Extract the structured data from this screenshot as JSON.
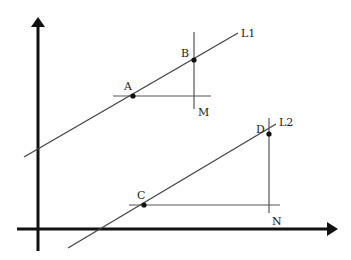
{
  "diagram": {
    "axes": {
      "x_axis": {
        "x1": 17,
        "y1": 229,
        "x2": 330,
        "y2": 229
      },
      "y_axis": {
        "x1": 38,
        "y1": 251,
        "x2": 38,
        "y2": 26
      }
    },
    "lines": [
      {
        "name": "L1",
        "label": "L1",
        "x1": 24,
        "y1": 157,
        "x2": 238,
        "y2": 33,
        "label_x": 241,
        "label_y": 37
      },
      {
        "name": "L2",
        "label": "L2",
        "x1": 68,
        "y1": 248,
        "x2": 276,
        "y2": 124,
        "label_x": 279,
        "label_y": 126
      }
    ],
    "guides": [
      {
        "name": "horizontal-through-A",
        "x1": 113,
        "y1": 96,
        "x2": 211,
        "y2": 96
      },
      {
        "name": "vertical-through-B",
        "x1": 194,
        "y1": 32,
        "x2": 194,
        "y2": 109
      },
      {
        "name": "horizontal-through-C",
        "x1": 129,
        "y1": 205,
        "x2": 280,
        "y2": 205
      },
      {
        "name": "vertical-through-D",
        "x1": 269,
        "y1": 118,
        "x2": 269,
        "y2": 213
      }
    ],
    "points": [
      {
        "label": "A",
        "x": 133,
        "y": 96,
        "label_x": 124,
        "label_y": 90
      },
      {
        "label": "B",
        "x": 194,
        "y": 60,
        "label_x": 181,
        "label_y": 57
      },
      {
        "label": "C",
        "x": 144,
        "y": 205,
        "label_x": 137,
        "label_y": 199
      },
      {
        "label": "D",
        "x": 269,
        "y": 134,
        "label_x": 256,
        "label_y": 133
      }
    ],
    "corner_labels": [
      {
        "label": "M",
        "x": 198,
        "y": 108
      },
      {
        "label": "N",
        "x": 272,
        "y": 217
      }
    ],
    "colors": {
      "axis": "#111111",
      "line": "#444444",
      "point": "#111111",
      "text": "#222222"
    }
  }
}
